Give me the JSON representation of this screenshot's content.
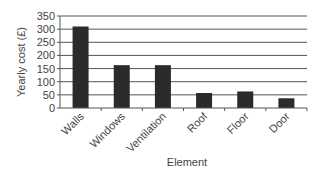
{
  "chart_data": {
    "type": "bar",
    "title": "",
    "xlabel": "Element",
    "ylabel": "Yearly cost (£)",
    "categories": [
      "Walls",
      "Windows",
      "Ventilation",
      "Roof",
      "Floor",
      "Door"
    ],
    "values": [
      310,
      163,
      163,
      57,
      63,
      37
    ],
    "ylim": [
      0,
      350
    ],
    "yticks": [
      0,
      50,
      100,
      150,
      200,
      250,
      300,
      350
    ],
    "grid": true,
    "legend": null,
    "bar_color": "#2b2b2b",
    "grid_color": "#555555"
  }
}
